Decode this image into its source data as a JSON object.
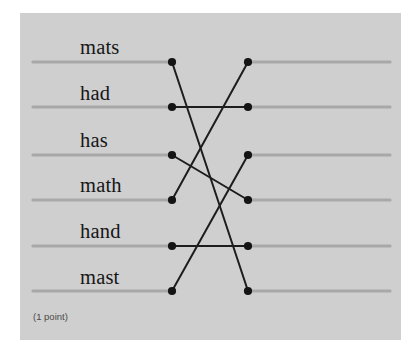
{
  "panel": {
    "background_color": "#cfcfcf",
    "points_note": "(1 point)"
  },
  "colors": {
    "panel_bg": "#cfcfcf",
    "row_line": "#a8a8a8",
    "connector_line": "#1d1d1d",
    "dot": "#141414",
    "label_text": "#161616",
    "note_text": "#4a4a4a",
    "page_bg": "#ffffff"
  },
  "question": {
    "type": "matching-line-puzzle",
    "left_items": [
      {
        "id": "L1",
        "label": "mats",
        "row": 1
      },
      {
        "id": "L2",
        "label": "had",
        "row": 2
      },
      {
        "id": "L3",
        "label": "has",
        "row": 3
      },
      {
        "id": "L4",
        "label": "math",
        "row": 4
      },
      {
        "id": "L5",
        "label": "hand",
        "row": 5
      },
      {
        "id": "L6",
        "label": "mast",
        "row": 6
      }
    ],
    "rows": [
      {
        "row": 1,
        "y": 49,
        "left_line_x1": 13,
        "left_line_x2": 152,
        "right_line_x1": 228,
        "right_line_x2": 370
      },
      {
        "row": 2,
        "y": 94,
        "left_line_x1": 13,
        "left_line_x2": 152,
        "right_line_x1": 228,
        "right_line_x2": 370
      },
      {
        "row": 3,
        "y": 142,
        "left_line_x1": 13,
        "left_line_x2": 152,
        "right_line_x1": 228,
        "right_line_x2": 370
      },
      {
        "row": 4,
        "y": 187,
        "left_line_x1": 13,
        "left_line_x2": 152,
        "right_line_x1": 228,
        "right_line_x2": 370
      },
      {
        "row": 5,
        "y": 233,
        "left_line_x1": 13,
        "left_line_x2": 152,
        "right_line_x1": 228,
        "right_line_x2": 370
      },
      {
        "row": 6,
        "y": 278,
        "left_line_x1": 13,
        "left_line_x2": 152,
        "right_line_x1": 228,
        "right_line_x2": 370
      }
    ],
    "left_nodes": [
      {
        "id": "L1",
        "x": 152,
        "y": 49
      },
      {
        "id": "L2",
        "x": 152,
        "y": 94
      },
      {
        "id": "L3",
        "x": 152,
        "y": 142
      },
      {
        "id": "L4",
        "x": 152,
        "y": 187
      },
      {
        "id": "L5",
        "x": 152,
        "y": 233
      },
      {
        "id": "L6",
        "x": 152,
        "y": 278
      }
    ],
    "right_nodes": [
      {
        "id": "R1",
        "x": 228,
        "y": 49
      },
      {
        "id": "R2",
        "x": 228,
        "y": 94
      },
      {
        "id": "R3",
        "x": 228,
        "y": 142
      },
      {
        "id": "R4",
        "x": 228,
        "y": 187
      },
      {
        "id": "R5",
        "x": 228,
        "y": 233
      },
      {
        "id": "R6",
        "x": 228,
        "y": 278
      }
    ],
    "connections": [
      {
        "from": "L1",
        "to": "R6",
        "from_row": 1,
        "to_row": 6
      },
      {
        "from": "L2",
        "to": "R2",
        "from_row": 2,
        "to_row": 2
      },
      {
        "from": "L3",
        "to": "R4",
        "from_row": 3,
        "to_row": 4
      },
      {
        "from": "L4",
        "to": "R1",
        "from_row": 4,
        "to_row": 1
      },
      {
        "from": "L5",
        "to": "R5",
        "from_row": 5,
        "to_row": 5
      },
      {
        "from": "L6",
        "to": "R3",
        "from_row": 6,
        "to_row": 3
      }
    ],
    "labels_position": [
      {
        "id": "L1",
        "x": 60,
        "y": 24
      },
      {
        "id": "L2",
        "x": 60,
        "y": 70
      },
      {
        "id": "L3",
        "x": 60,
        "y": 117
      },
      {
        "id": "L4",
        "x": 60,
        "y": 162
      },
      {
        "id": "L5",
        "x": 60,
        "y": 208
      },
      {
        "id": "L6",
        "x": 60,
        "y": 254
      }
    ]
  }
}
